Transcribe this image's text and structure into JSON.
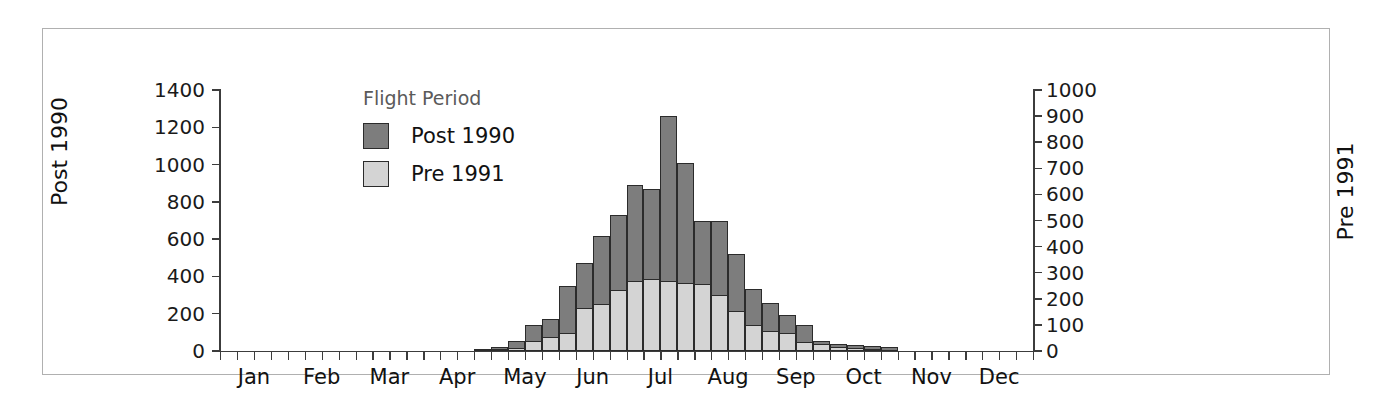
{
  "chart_data": {
    "type": "bar",
    "title": "",
    "subtitle": "",
    "barmode": "overlay",
    "xlabel": "",
    "ylabel": "Post 1990",
    "y2label": "Pre 1991",
    "ylim": [
      0,
      1400
    ],
    "y2lim": [
      0,
      1000
    ],
    "yticks": [
      0,
      200,
      400,
      600,
      800,
      1000,
      1200,
      1400
    ],
    "ytick_labels": [
      "0",
      "200",
      "400",
      "600",
      "800",
      "1000",
      "1200",
      "1400"
    ],
    "y2ticks": [
      0,
      100,
      200,
      300,
      400,
      500,
      600,
      700,
      800,
      900,
      1000
    ],
    "y2tick_labels": [
      "0",
      "100",
      "200",
      "300",
      "400",
      "500",
      "600",
      "700",
      "800",
      "900",
      "1000"
    ],
    "grid": false,
    "legend_title": "Flight Period",
    "legend_position": "top-left-inside",
    "xtick_labels": [
      "Jan",
      "Feb",
      "Mar",
      "Apr",
      "May",
      "Jun",
      "Jul",
      "Aug",
      "Sep",
      "Oct",
      "Nov",
      "Dec"
    ],
    "x_bins_per_month": 4,
    "colors": {
      "post_1990": "#7d7d7d",
      "pre_1991": "#d4d4d4",
      "outline": "#2b2b2b",
      "axis": "#3c3c3c",
      "frame": "#b0b0b0"
    },
    "series": [
      {
        "name": "Post 1990",
        "axis": "left",
        "color": "#7d7d7d",
        "values": [
          0,
          0,
          0,
          0,
          0,
          0,
          0,
          0,
          0,
          0,
          0,
          0,
          0,
          0,
          0,
          10,
          20,
          55,
          140,
          170,
          350,
          470,
          615,
          730,
          890,
          870,
          1260,
          1010,
          700,
          700,
          520,
          335,
          255,
          195,
          140,
          55,
          35,
          30,
          25,
          20,
          0,
          0,
          0,
          0,
          0,
          0,
          0,
          0
        ]
      },
      {
        "name": "Pre 1991",
        "axis": "right",
        "color": "#d4d4d4",
        "values": [
          0,
          0,
          0,
          0,
          0,
          0,
          0,
          0,
          0,
          0,
          0,
          0,
          0,
          0,
          0,
          0,
          5,
          10,
          40,
          55,
          70,
          165,
          180,
          235,
          270,
          275,
          270,
          260,
          255,
          215,
          155,
          100,
          75,
          70,
          35,
          25,
          15,
          10,
          5,
          0,
          0,
          0,
          0,
          0,
          0,
          0,
          0,
          0
        ]
      }
    ]
  },
  "legend": {
    "title": "Flight Period",
    "items": [
      {
        "label": "Post 1990",
        "color": "#7d7d7d"
      },
      {
        "label": "Pre 1991",
        "color": "#d4d4d4"
      }
    ]
  },
  "axes": {
    "left_title": "Post 1990",
    "right_title": "Pre 1991"
  }
}
